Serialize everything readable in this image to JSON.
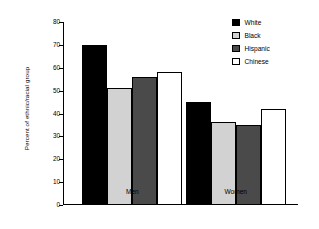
{
  "chart_data": {
    "type": "bar",
    "title": "",
    "xlabel": "",
    "ylabel": "Percent of ethnic/racial group",
    "ylim": [
      0,
      80
    ],
    "yticks": [
      0,
      10,
      20,
      30,
      40,
      50,
      60,
      70,
      80
    ],
    "ytick_labels": [
      "0",
      "10",
      "20",
      "30",
      "40",
      "50",
      "60",
      "70",
      "80"
    ],
    "grid": false,
    "legend_position": "top-right",
    "categories": [
      "Men",
      "Women"
    ],
    "series": [
      {
        "name": "White",
        "values": [
          70,
          45
        ],
        "color": "#000000"
      },
      {
        "name": "Black",
        "values": [
          51,
          36.5
        ],
        "color": "#d2d2d2"
      },
      {
        "name": "Hispanic",
        "values": [
          56,
          35
        ],
        "color": "#4a4a4a"
      },
      {
        "name": "Chinese",
        "values": [
          58,
          42
        ],
        "color": "#ffffff"
      }
    ]
  },
  "axis": {
    "y_title": "Percent of ethnic/racial group"
  },
  "legend": {
    "items": [
      {
        "label": "White"
      },
      {
        "label": "Black"
      },
      {
        "label": "Hispanic"
      },
      {
        "label": "Chinese"
      }
    ]
  },
  "groups": [
    {
      "label": "Men"
    },
    {
      "label": "Women"
    }
  ]
}
